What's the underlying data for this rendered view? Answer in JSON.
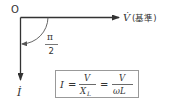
{
  "diagram": {
    "origin_label": "O",
    "voltage_label": "V̇",
    "reference_label": "(基準)",
    "current_label": "İ",
    "angle": {
      "numerator": "π",
      "denominator": "2"
    },
    "formula": {
      "lhs": "I",
      "eq1": "=",
      "frac1_num": "V",
      "frac1_den_main": "X",
      "frac1_den_sub": "L",
      "eq2": "=",
      "frac2_num": "V",
      "frac2_den": "ωL"
    },
    "colors": {
      "line": "#333333",
      "arc": "#555555",
      "box_border": "#999999"
    }
  }
}
